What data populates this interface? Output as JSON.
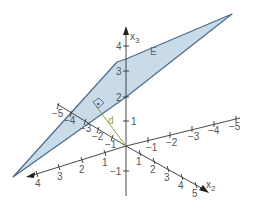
{
  "diagram": {
    "plane": {
      "label": "E",
      "fill": "#c9dbe8",
      "stroke": "#4d6b8a"
    },
    "distance": {
      "label": "d",
      "color": "#8aa63a"
    },
    "axes": {
      "x3": {
        "label": "x",
        "sub": "3",
        "ticks": [
          "4",
          "3",
          "2",
          "1",
          "−1"
        ]
      },
      "x2": {
        "label": "x",
        "sub": "2",
        "ticks": [
          "1",
          "2",
          "3",
          "4",
          "5"
        ]
      },
      "x2_neg": {
        "ticks": [
          "−1",
          "−2",
          "−3",
          "−4",
          "−5"
        ]
      },
      "x1": {
        "ticks": [
          "1",
          "2",
          "3",
          "4"
        ]
      },
      "x1_neg": {
        "ticks": [
          "−1",
          "−2",
          "−3",
          "−4",
          "−5"
        ]
      }
    },
    "right_angle_marker": {
      "dot": "•"
    }
  }
}
